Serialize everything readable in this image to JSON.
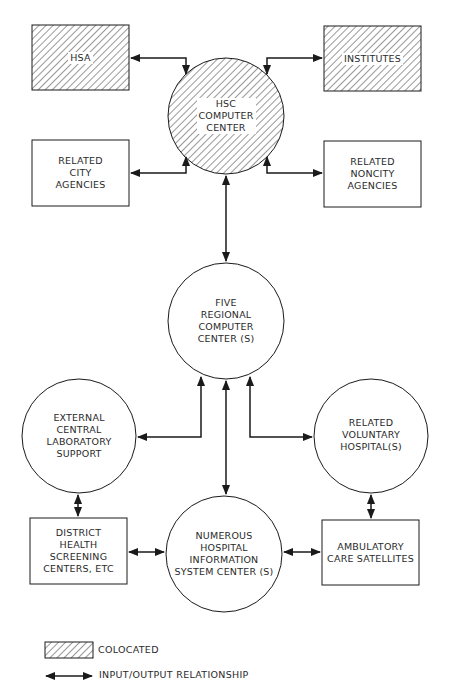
{
  "diagram": {
    "nodes": {
      "hsa": {
        "label": "HSA",
        "shape": "rectangle",
        "colocated": true
      },
      "institutes": {
        "label": "INSTITUTES",
        "shape": "rectangle",
        "colocated": true
      },
      "hsc": {
        "label": "HSC\nCOMPUTER\nCENTER",
        "shape": "circle",
        "colocated": true
      },
      "city": {
        "label": "RELATED\nCITY\nAGENCIES",
        "shape": "rectangle",
        "colocated": false
      },
      "noncity": {
        "label": "RELATED\nNONCITY\nAGENCIES",
        "shape": "rectangle",
        "colocated": false
      },
      "regional": {
        "label": "FIVE\nREGIONAL\nCOMPUTER\nCENTER (S)",
        "shape": "circle",
        "colocated": false
      },
      "lab": {
        "label": "EXTERNAL\nCENTRAL\nLABORATORY\nSUPPORT",
        "shape": "circle",
        "colocated": false
      },
      "voluntary": {
        "label": "RELATED\nVOLUNTARY\nHOSPITAL(S)",
        "shape": "circle",
        "colocated": false
      },
      "district": {
        "label": "DISTRICT\nHEALTH\nSCREENING\nCENTERS, ETC",
        "shape": "rectangle",
        "colocated": false
      },
      "his": {
        "label": "NUMEROUS\nHOSPITAL\nINFORMATION\nSYSTEM CENTER (S)",
        "shape": "circle",
        "colocated": false
      },
      "ambulatory": {
        "label": "AMBULATORY\nCARE SATELLITES",
        "shape": "rectangle",
        "colocated": false
      }
    },
    "edges": [
      {
        "from": "hsa",
        "to": "hsc",
        "type": "input/output"
      },
      {
        "from": "institutes",
        "to": "hsc",
        "type": "input/output"
      },
      {
        "from": "city",
        "to": "hsc",
        "type": "input/output"
      },
      {
        "from": "noncity",
        "to": "hsc",
        "type": "input/output"
      },
      {
        "from": "hsc",
        "to": "regional",
        "type": "input/output"
      },
      {
        "from": "regional",
        "to": "lab",
        "type": "input/output"
      },
      {
        "from": "regional",
        "to": "voluntary",
        "type": "input/output"
      },
      {
        "from": "regional",
        "to": "his",
        "type": "input/output"
      },
      {
        "from": "lab",
        "to": "district",
        "type": "input/output"
      },
      {
        "from": "voluntary",
        "to": "ambulatory",
        "type": "input/output"
      },
      {
        "from": "district",
        "to": "his",
        "type": "input/output"
      },
      {
        "from": "his",
        "to": "ambulatory",
        "type": "input/output"
      }
    ]
  },
  "legend": {
    "colocated": "COLOCATED",
    "io": "INPUT/OUTPUT RELATIONSHIP"
  },
  "colors": {
    "line": "#1a1a1a",
    "hatch": "#333333",
    "background": "#ffffff"
  }
}
